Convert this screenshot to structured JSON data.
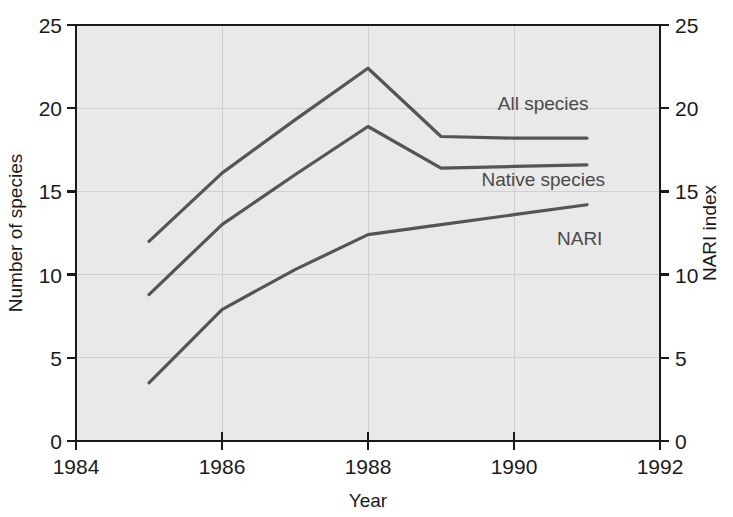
{
  "chart_data": {
    "type": "line",
    "title": "",
    "subtitle": "",
    "xlabel": "Year",
    "ylabel": "Number of species",
    "y2label": "NARI index",
    "xlim": [
      1984,
      1992
    ],
    "ylim": [
      0,
      25
    ],
    "y2lim": [
      0,
      25
    ],
    "grid": true,
    "legend_position": "inline-right",
    "background_color": "#e9e9e9",
    "line_color": "#555555",
    "axis_color": "#1a1a1a",
    "grid_color": "#cfcfcf",
    "x_ticks": [
      "1984",
      "1986",
      "1988",
      "1990",
      "1992"
    ],
    "x_tick_values": [
      1984,
      1986,
      1988,
      1990,
      1992
    ],
    "y_ticks": [
      "0",
      "5",
      "10",
      "15",
      "20",
      "25"
    ],
    "y_tick_values": [
      0,
      5,
      10,
      15,
      20,
      25
    ],
    "y2_ticks": [
      "0",
      "5",
      "10",
      "15",
      "20",
      "25"
    ],
    "y2_tick_values": [
      0,
      5,
      10,
      15,
      20,
      25
    ],
    "x": [
      1985,
      1986,
      1987,
      1988,
      1989,
      1990,
      1991
    ],
    "series": [
      {
        "name": "All species",
        "axis": "left",
        "values": [
          12.0,
          16.1,
          19.3,
          22.4,
          18.3,
          18.2,
          18.2
        ],
        "label_x": 1990.4,
        "label_y": 19.9
      },
      {
        "name": "Native species",
        "axis": "left",
        "values": [
          8.8,
          13.0,
          16.0,
          18.9,
          16.4,
          16.5,
          16.6
        ],
        "label_x": 1990.4,
        "label_y": 15.3
      },
      {
        "name": "NARI",
        "axis": "right",
        "values": [
          3.5,
          7.9,
          10.3,
          12.4,
          13.0,
          13.6,
          14.2
        ],
        "label_x": 1990.9,
        "label_y": 11.8
      }
    ]
  },
  "labels": {
    "x_axis_title": "Year",
    "y_axis_title": "Number of species",
    "y2_axis_title": "NARI index",
    "series_all": "All species",
    "series_native": "Native species",
    "series_nari": "NARI",
    "x_tick_0": "1984",
    "x_tick_1": "1986",
    "x_tick_2": "1988",
    "x_tick_3": "1990",
    "x_tick_4": "1992",
    "y_tick_0": "0",
    "y_tick_1": "5",
    "y_tick_2": "10",
    "y_tick_3": "15",
    "y_tick_4": "20",
    "y_tick_5": "25",
    "y2_tick_0": "0",
    "y2_tick_1": "5",
    "y2_tick_2": "10",
    "y2_tick_3": "15",
    "y2_tick_4": "20",
    "y2_tick_5": "25"
  }
}
